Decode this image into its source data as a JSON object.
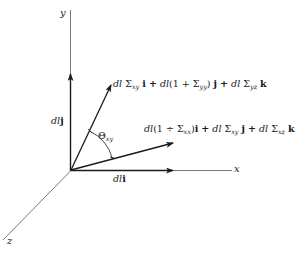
{
  "figure": {
    "axes": {
      "x_label": "x",
      "y_label": "y",
      "z_label": "z"
    },
    "vectors": {
      "i_vector": {
        "dl": "dl",
        "unit": "i"
      },
      "j_vector": {
        "dl": "dl",
        "unit": "j"
      },
      "deformed_y": {
        "t1_dl": "dl",
        "t1_sigma": "Σ",
        "t1_sub": "xy",
        "t1_unit": "i",
        "plus1": "+",
        "t2_dl": "dl",
        "t2_open": "(1 +",
        "t2_sigma": "Σ",
        "t2_sub": "yy",
        "t2_close": ")",
        "t2_unit": "j",
        "plus2": "+",
        "t3_dl": "dl",
        "t3_sigma": "Σ",
        "t3_sub": "yz",
        "t3_unit": "k"
      },
      "deformed_x": {
        "t1_dl": "dl",
        "t1_open": "(1 ÷",
        "t1_sigma": "Σ",
        "t1_sub": "xx",
        "t1_close": ")",
        "t1_unit": "i",
        "plus1": "+",
        "t2_dl": "dl",
        "t2_sigma": "Σ",
        "t2_sub": "xy",
        "t2_unit": "j",
        "plus2": "+",
        "t3_dl": "dl",
        "t3_sigma": "Σ",
        "t3_sub": "xz",
        "t3_unit": "k"
      }
    },
    "angle": {
      "symbol": "Θ",
      "sub": "xy"
    },
    "colors": {
      "ink": "#1a1a1a",
      "axis": "#555555",
      "background": "#ffffff"
    }
  }
}
